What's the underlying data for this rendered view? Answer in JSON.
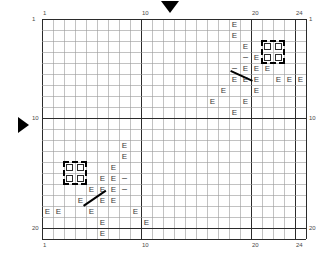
{
  "figure": {
    "title": "",
    "grid": {
      "origin_x": 42,
      "origin_y": 19,
      "cell": 11,
      "cols": 24,
      "rows": 20,
      "minor_color": "#9a9a9a",
      "major_color": "#2b2b2b",
      "major_every_x": [
        1,
        10,
        20,
        24
      ],
      "major_every_y": [
        1,
        10,
        20
      ]
    },
    "axes": {
      "top_labels": [
        {
          "text": "1",
          "col": 1
        },
        {
          "text": "10",
          "col": 10
        },
        {
          "text": "20",
          "col": 20
        },
        {
          "text": "24",
          "col": 24
        }
      ],
      "bottom_labels": [
        {
          "text": "1",
          "col": 1
        },
        {
          "text": "10",
          "col": 10
        },
        {
          "text": "20",
          "col": 20
        },
        {
          "text": "24",
          "col": 24
        }
      ],
      "left_labels": [
        {
          "text": "1",
          "row": 1
        },
        {
          "text": "10",
          "row": 10
        },
        {
          "text": "20",
          "row": 20
        }
      ],
      "right_labels": [
        {
          "text": "1",
          "row": 1
        },
        {
          "text": "10",
          "row": 10
        },
        {
          "text": "20",
          "row": 20
        }
      ]
    },
    "markers": [
      {
        "name": "column-pointer",
        "shape": "triangle-down",
        "x": 161,
        "y": 1
      },
      {
        "name": "row-pointer",
        "shape": "triangle-right",
        "x": 18,
        "y": 117
      }
    ],
    "glyphs": [
      {
        "sym": "E",
        "col": 18,
        "row": 1
      },
      {
        "sym": "E",
        "col": 18,
        "row": 2
      },
      {
        "sym": "E",
        "col": 19,
        "row": 3
      },
      {
        "sym": "-",
        "col": 19,
        "row": 4
      },
      {
        "sym": "E",
        "col": 20,
        "row": 4
      },
      {
        "sym": "-",
        "col": 18,
        "row": 5
      },
      {
        "sym": "E",
        "col": 19,
        "row": 5
      },
      {
        "sym": "E",
        "col": 20,
        "row": 5
      },
      {
        "sym": "E",
        "col": 21,
        "row": 5
      },
      {
        "sym": "E",
        "col": 18,
        "row": 6
      },
      {
        "sym": "E",
        "col": 19,
        "row": 6
      },
      {
        "sym": "E",
        "col": 20,
        "row": 6
      },
      {
        "sym": "E",
        "col": 22,
        "row": 6
      },
      {
        "sym": "E",
        "col": 23,
        "row": 6
      },
      {
        "sym": "E",
        "col": 24,
        "row": 6
      },
      {
        "sym": "E",
        "col": 17,
        "row": 7
      },
      {
        "sym": "E",
        "col": 20,
        "row": 7
      },
      {
        "sym": "E",
        "col": 16,
        "row": 8
      },
      {
        "sym": "E",
        "col": 19,
        "row": 8
      },
      {
        "sym": "E",
        "col": 18,
        "row": 9
      },
      {
        "sym": "E",
        "col": 8,
        "row": 12
      },
      {
        "sym": "E",
        "col": 8,
        "row": 13
      },
      {
        "sym": "E",
        "col": 7,
        "row": 14
      },
      {
        "sym": "E",
        "col": 6,
        "row": 15
      },
      {
        "sym": "E",
        "col": 7,
        "row": 15
      },
      {
        "sym": "-",
        "col": 8,
        "row": 15
      },
      {
        "sym": "E",
        "col": 5,
        "row": 16
      },
      {
        "sym": "E",
        "col": 6,
        "row": 16
      },
      {
        "sym": "E",
        "col": 7,
        "row": 16
      },
      {
        "sym": "-",
        "col": 8,
        "row": 16
      },
      {
        "sym": "E",
        "col": 4,
        "row": 17
      },
      {
        "sym": "E",
        "col": 6,
        "row": 17
      },
      {
        "sym": "E",
        "col": 7,
        "row": 17
      },
      {
        "sym": "E",
        "col": 1,
        "row": 18
      },
      {
        "sym": "E",
        "col": 2,
        "row": 18
      },
      {
        "sym": "E",
        "col": 5,
        "row": 18
      },
      {
        "sym": "E",
        "col": 9,
        "row": 18
      },
      {
        "sym": "E",
        "col": 6,
        "row": 19
      },
      {
        "sym": "E",
        "col": 10,
        "row": 19
      },
      {
        "sym": "E",
        "col": 6,
        "row": 20
      }
    ],
    "squares": [
      {
        "col": 21,
        "row": 3
      },
      {
        "col": 22,
        "row": 3
      },
      {
        "col": 21,
        "row": 4
      },
      {
        "col": 22,
        "row": 4
      },
      {
        "col": 3,
        "row": 14
      },
      {
        "col": 4,
        "row": 14
      },
      {
        "col": 3,
        "row": 15
      },
      {
        "col": 4,
        "row": 15
      }
    ],
    "dashed_boxes": [
      {
        "name": "selection-box-top-right",
        "col": 21,
        "row": 3,
        "w": 2,
        "h": 2
      },
      {
        "name": "selection-box-bottom-left",
        "col": 3,
        "row": 14,
        "w": 2,
        "h": 2
      }
    ],
    "line_segments": [
      {
        "name": "vector-top-right",
        "x1": 231,
        "y1": 70,
        "x2": 253,
        "y2": 80
      },
      {
        "name": "vector-bottom-left",
        "x1": 83,
        "y1": 205,
        "x2": 105,
        "y2": 190
      }
    ]
  }
}
